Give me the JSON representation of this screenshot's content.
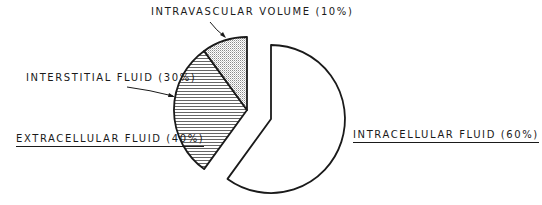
{
  "chart_data": {
    "type": "pie",
    "title": "",
    "exploded": true,
    "slices": [
      {
        "label": "INTRACELLULAR FLUID",
        "value": 60,
        "fill": "white",
        "group": "intracellular"
      },
      {
        "label": "INTERSTITIAL FLUID",
        "value": 30,
        "fill": "horizontal-hatch",
        "group": "extracellular"
      },
      {
        "label": "INTRAVASCULAR VOLUME",
        "value": 10,
        "fill": "dotted",
        "group": "extracellular"
      }
    ],
    "groups": [
      {
        "label": "EXTRACELLULAR FLUID",
        "value": 40,
        "members": [
          "INTERSTITIAL FLUID",
          "INTRAVASCULAR VOLUME"
        ]
      },
      {
        "label": "INTRACELLULAR FLUID",
        "value": 60,
        "members": [
          "INTRACELLULAR FLUID"
        ]
      }
    ],
    "units": "%"
  },
  "labels": {
    "intravascular": "INTRAVASCULAR VOLUME (10%)",
    "interstitial": "INTERSTITIAL FLUID (30%)",
    "extracellular": "EXTRACELLULAR FLUID (40%)",
    "intracellular": "INTRACELLULAR FLUID (60%)"
  },
  "colors": {
    "stroke": "#1a1a1a",
    "background": "#ffffff",
    "dot_fill": "#d9d9d9"
  }
}
